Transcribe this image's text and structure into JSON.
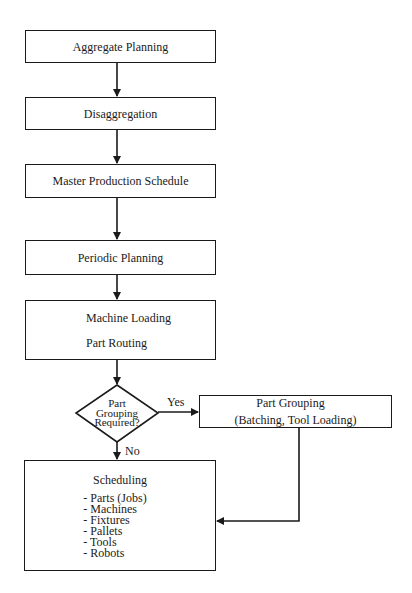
{
  "diagram": {
    "type": "flowchart",
    "nodes": {
      "aggregate_planning": "Aggregate Planning",
      "disaggregation": "Disaggregation",
      "master_production_schedule": "Master Production Schedule",
      "periodic_planning": "Periodic Planning",
      "machine_loading": {
        "line1": "Machine Loading",
        "line2": "Part Routing"
      },
      "decision": {
        "line1": "Part",
        "line2": "Grouping",
        "line3": "Required?"
      },
      "part_grouping": {
        "line1": "Part Grouping",
        "line2": "(Batching, Tool Loading)"
      },
      "scheduling": {
        "title": "Scheduling",
        "items": [
          "- Parts (Jobs)",
          "- Machines",
          "- Fixtures",
          "- Pallets",
          "- Tools",
          "- Robots"
        ]
      }
    },
    "edge_labels": {
      "yes": "Yes",
      "no": "No"
    },
    "colors": {
      "stroke": "#1a1a1a",
      "background": "#ffffff"
    }
  }
}
